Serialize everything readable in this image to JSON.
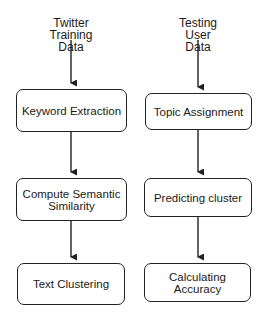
{
  "diagram": {
    "type": "flowchart",
    "columns": [
      {
        "input": {
          "lines": [
            "Twitter",
            "Training",
            "Data"
          ]
        },
        "steps": [
          {
            "lines": [
              "Keyword Extraction"
            ]
          },
          {
            "lines": [
              "Compute Semantic",
              "Similarity"
            ]
          },
          {
            "lines": [
              "Text Clustering"
            ]
          }
        ]
      },
      {
        "input": {
          "lines": [
            "Testing",
            "User",
            "Data"
          ]
        },
        "steps": [
          {
            "lines": [
              "Topic Assignment"
            ]
          },
          {
            "lines": [
              "Predicting cluster"
            ]
          },
          {
            "lines": [
              "Calculating",
              "Accuracy"
            ]
          }
        ]
      }
    ],
    "colors": {
      "stroke": "#222222",
      "text": "#1a1a1a",
      "background": "#ffffff"
    }
  }
}
